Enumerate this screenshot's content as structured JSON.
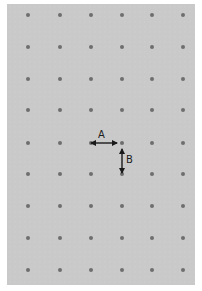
{
  "figure": {
    "background_color": "#c9c9c9",
    "dot_color": "#6e6e6e",
    "grid": {
      "columns": 6,
      "rows": 9,
      "column_x": [
        28,
        60,
        91,
        122,
        152,
        183
      ],
      "row_y": [
        15,
        47,
        79,
        110,
        143,
        174,
        206,
        238,
        270
      ]
    },
    "annotations": [
      {
        "label": "A",
        "orientation": "horizontal",
        "description": "horizontal spacing between adjacent dots"
      },
      {
        "label": "B",
        "orientation": "vertical",
        "description": "vertical spacing between adjacent dots"
      }
    ]
  }
}
